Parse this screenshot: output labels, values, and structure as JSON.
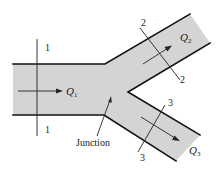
{
  "figure": {
    "colors": {
      "pipe_fill": "#d4d4d4",
      "wall": "#111111",
      "annotation": "#222222",
      "background": "#ffffff"
    }
  },
  "sections": {
    "s1": {
      "label_top": "1",
      "label_bottom": "1"
    },
    "s2": {
      "label_top": "2",
      "label_bottom": "2"
    },
    "s3": {
      "label_top": "3",
      "label_bottom": "3"
    }
  },
  "flows": {
    "q1": {
      "symbol": "Q",
      "subscript": "1"
    },
    "q2": {
      "symbol": "Q",
      "subscript": "2"
    },
    "q3": {
      "symbol": "Q",
      "subscript": "3"
    }
  },
  "annotations": {
    "junction": "Junction"
  }
}
